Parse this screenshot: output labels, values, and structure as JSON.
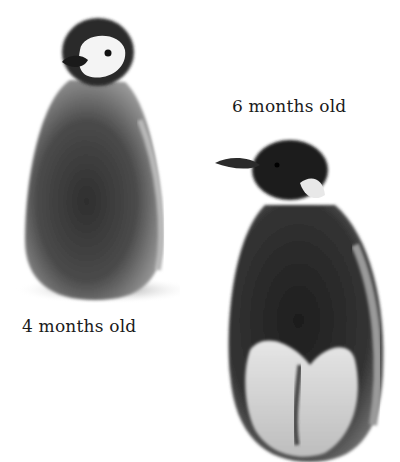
{
  "image": {
    "description": "Two emperor penguin chicks at different ages",
    "background_color": "#ffffff"
  },
  "figures": [
    {
      "id": "chick-4-months",
      "caption": "4 months old",
      "subject": "fluffy grey emperor penguin chick with white face mask and dark cap"
    },
    {
      "id": "chick-6-months",
      "caption": "6 months old",
      "subject": "moulting emperor penguin juvenile with dark head, dark down and white belly showing"
    }
  ]
}
